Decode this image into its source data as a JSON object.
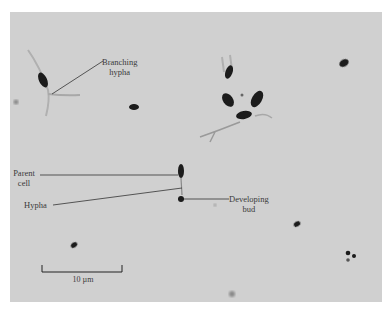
{
  "figure": {
    "type": "light micrograph",
    "background_color": "#d0d0d0",
    "cell_color": "#1a1a1a"
  },
  "annotations": {
    "branching_hypha": {
      "line1": "Branching",
      "line2": "hypha"
    },
    "parent_cell": {
      "line1": "Parent",
      "line2": "cell"
    },
    "hypha": {
      "text": "Hypha"
    },
    "developing_bud": {
      "line1": "Developing",
      "line2": "bud"
    }
  },
  "scale_bar": {
    "label": "10 µm",
    "length_um": 10
  }
}
